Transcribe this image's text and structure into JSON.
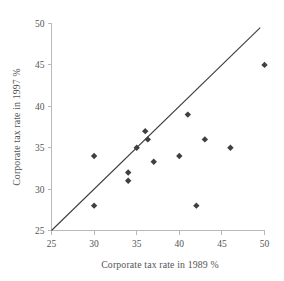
{
  "chart_data": {
    "type": "scatter",
    "title": "",
    "subtitle": "",
    "xlabel": "Corporate tax rate in 1989 %",
    "ylabel": "Corporate tax rate in 1997 %",
    "xlim": [
      25,
      50
    ],
    "ylim": [
      25,
      50
    ],
    "xticks": [
      25,
      30,
      35,
      40,
      45,
      50
    ],
    "yticks": [
      25,
      30,
      35,
      40,
      45,
      50
    ],
    "xtick_labels": [
      "25",
      "30",
      "35",
      "40",
      "45",
      "50"
    ],
    "ytick_labels": [
      "25",
      "30",
      "35",
      "40",
      "45",
      "50"
    ],
    "grid": false,
    "legend": false,
    "legend_position": "none",
    "marker_shape": "diamond",
    "marker_color": "#3f3f3f",
    "series": [
      {
        "name": "Countries",
        "points": [
          {
            "x": 30,
            "y": 34
          },
          {
            "x": 30,
            "y": 28
          },
          {
            "x": 34,
            "y": 32
          },
          {
            "x": 34,
            "y": 31
          },
          {
            "x": 35,
            "y": 35
          },
          {
            "x": 36,
            "y": 37
          },
          {
            "x": 36.3,
            "y": 36
          },
          {
            "x": 37,
            "y": 33.3
          },
          {
            "x": 40,
            "y": 34
          },
          {
            "x": 41,
            "y": 39
          },
          {
            "x": 42,
            "y": 28
          },
          {
            "x": 43,
            "y": 36
          },
          {
            "x": 46,
            "y": 35
          },
          {
            "x": 50,
            "y": 45
          }
        ]
      }
    ],
    "reference_line": {
      "name": "identity-line",
      "from": {
        "x": 25,
        "y": 25
      },
      "to": {
        "x": 49.5,
        "y": 49.5
      },
      "color": "#3d3d3d"
    }
  }
}
